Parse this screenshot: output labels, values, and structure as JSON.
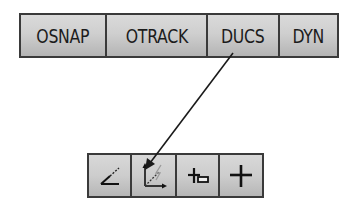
{
  "status_bar": {
    "buttons": [
      {
        "label": "OSNAP"
      },
      {
        "label": "OTRACK"
      },
      {
        "label": "DUCS"
      },
      {
        "label": "DYN"
      }
    ]
  },
  "toolbar": {
    "buttons": [
      {
        "icon": "polar-tracking-icon"
      },
      {
        "icon": "dynamic-ucs-icon"
      },
      {
        "icon": "object-snap-tracking-icon"
      },
      {
        "icon": "crosshair-icon"
      }
    ]
  },
  "callout": {
    "from": "DUCS",
    "to": "dynamic-ucs-icon"
  },
  "colors": {
    "button_top": "#dadada",
    "button_bottom": "#b4b4b4",
    "border": "#3a3a3a",
    "text": "#1c1c1c"
  }
}
